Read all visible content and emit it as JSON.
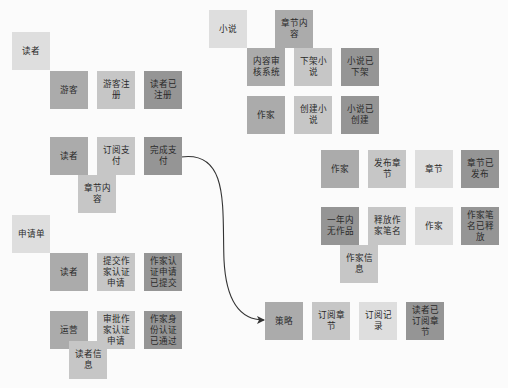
{
  "diagram": {
    "type": "event-storming",
    "colors": {
      "light": "#dedede",
      "command": "#c6c6c6",
      "actor": "#ababab",
      "event": "#959595",
      "background": "#fbfbfb",
      "arrow": "#333333"
    },
    "notes": [
      {
        "id": "n1",
        "label": "读者",
        "x": 12,
        "y": 32,
        "kind": "light"
      },
      {
        "id": "n2",
        "label": "游客",
        "x": 50,
        "y": 71,
        "kind": "actor"
      },
      {
        "id": "n3",
        "label": "游客注册",
        "x": 97,
        "y": 71,
        "kind": "command"
      },
      {
        "id": "n4",
        "label": "读者已注册",
        "x": 144,
        "y": 71,
        "kind": "event"
      },
      {
        "id": "n5",
        "label": "小说",
        "x": 209,
        "y": 10,
        "kind": "light"
      },
      {
        "id": "n6",
        "label": "章节内容",
        "x": 275,
        "y": 10,
        "kind": "actor"
      },
      {
        "id": "n7",
        "label": "内容审核系统",
        "x": 247,
        "y": 48,
        "kind": "actor"
      },
      {
        "id": "n8",
        "label": "下架小说",
        "x": 294,
        "y": 48,
        "kind": "command"
      },
      {
        "id": "n9",
        "label": "小说已下架",
        "x": 341,
        "y": 48,
        "kind": "event"
      },
      {
        "id": "n10",
        "label": "作家",
        "x": 247,
        "y": 96,
        "kind": "actor"
      },
      {
        "id": "n11",
        "label": "创建小说",
        "x": 294,
        "y": 96,
        "kind": "command"
      },
      {
        "id": "n12",
        "label": "小说已创建",
        "x": 341,
        "y": 96,
        "kind": "event"
      },
      {
        "id": "n13",
        "label": "读者",
        "x": 50,
        "y": 137,
        "kind": "actor"
      },
      {
        "id": "n14",
        "label": "订阅支付",
        "x": 97,
        "y": 137,
        "kind": "command"
      },
      {
        "id": "n15",
        "label": "完成支付",
        "x": 144,
        "y": 137,
        "kind": "event"
      },
      {
        "id": "n16",
        "label": "章节内容",
        "x": 78,
        "y": 175,
        "kind": "command"
      },
      {
        "id": "n17",
        "label": "作家",
        "x": 321,
        "y": 150,
        "kind": "actor"
      },
      {
        "id": "n18",
        "label": "发布章节",
        "x": 368,
        "y": 150,
        "kind": "command"
      },
      {
        "id": "n19",
        "label": "章节",
        "x": 415,
        "y": 150,
        "kind": "light"
      },
      {
        "id": "n20",
        "label": "章节已发布",
        "x": 461,
        "y": 150,
        "kind": "event"
      },
      {
        "id": "n21",
        "label": "一年内无作品",
        "x": 321,
        "y": 207,
        "kind": "event"
      },
      {
        "id": "n22",
        "label": "释放作家笔名",
        "x": 368,
        "y": 207,
        "kind": "command"
      },
      {
        "id": "n23",
        "label": "作家",
        "x": 415,
        "y": 207,
        "kind": "light"
      },
      {
        "id": "n24",
        "label": "作家笔名已释放",
        "x": 461,
        "y": 207,
        "kind": "event"
      },
      {
        "id": "n25",
        "label": "作家信息",
        "x": 340,
        "y": 245,
        "kind": "command"
      },
      {
        "id": "n26",
        "label": "申请单",
        "x": 12,
        "y": 215,
        "kind": "light"
      },
      {
        "id": "n27",
        "label": "读者",
        "x": 50,
        "y": 253,
        "kind": "actor"
      },
      {
        "id": "n28",
        "label": "提交作家认证申请",
        "x": 97,
        "y": 253,
        "kind": "command"
      },
      {
        "id": "n29",
        "label": "作家认证申请已提交",
        "x": 144,
        "y": 253,
        "kind": "event"
      },
      {
        "id": "n30",
        "label": "运营",
        "x": 50,
        "y": 311,
        "kind": "actor"
      },
      {
        "id": "n31",
        "label": "审批作家认证申请",
        "x": 97,
        "y": 311,
        "kind": "command"
      },
      {
        "id": "n32",
        "label": "作家身份认证已通过",
        "x": 144,
        "y": 311,
        "kind": "event"
      },
      {
        "id": "n33",
        "label": "读者信息",
        "x": 69,
        "y": 341,
        "kind": "command"
      },
      {
        "id": "n34",
        "label": "策略",
        "x": 265,
        "y": 302,
        "kind": "actor"
      },
      {
        "id": "n35",
        "label": "订阅章节",
        "x": 312,
        "y": 302,
        "kind": "command"
      },
      {
        "id": "n36",
        "label": "订阅记录",
        "x": 359,
        "y": 302,
        "kind": "light"
      },
      {
        "id": "n37",
        "label": "读者已订阅章节",
        "x": 406,
        "y": 302,
        "kind": "event"
      }
    ],
    "edges": [
      {
        "from": "完成支付",
        "to": "策略",
        "path": "M181,157 C230,150 222,210 224,260 C226,300 240,320 264,320"
      }
    ]
  }
}
